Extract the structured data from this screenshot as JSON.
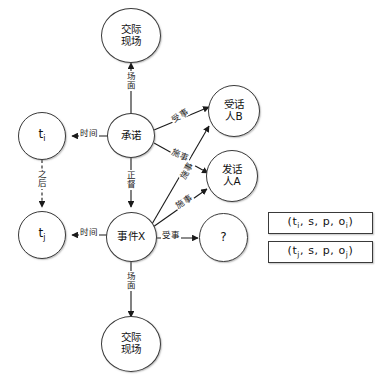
{
  "diagram": {
    "nodes": {
      "scene_top": {
        "line1": "交际",
        "line2": "现场"
      },
      "scene_bottom": {
        "line1": "交际",
        "line2": "现场"
      },
      "ti": {
        "label": "t",
        "sub": "i"
      },
      "tj": {
        "label": "t",
        "sub": "j"
      },
      "promise": {
        "label": "承诺"
      },
      "event_x": {
        "label": "事件X"
      },
      "addressee_b": {
        "line1": "受话",
        "line2": "人B"
      },
      "speaker_a": {
        "line1": "发话",
        "line2": "人A"
      },
      "unknown": {
        "label": "?"
      }
    },
    "edge_labels": {
      "scene_top": "场面",
      "scene_bottom": "场面",
      "time_upper": "时间",
      "time_lower": "时间",
      "after": "之后",
      "modality": "正督",
      "patient_promise_to_b": "受事",
      "agent_promise_to_a": "施事",
      "agent_event_to_b": "施事",
      "agent_event_to_a": "施事",
      "patient_event_to_unknown": "受事"
    },
    "formulas": [
      {
        "open": "(t",
        "sub1": "i",
        "mid": ",  s,  p,  o",
        "sub2": "i",
        "close": ")"
      },
      {
        "open": "(t",
        "sub1": "j",
        "mid": ",  s,  p,  o",
        "sub2": "j",
        "close": ")"
      }
    ]
  }
}
